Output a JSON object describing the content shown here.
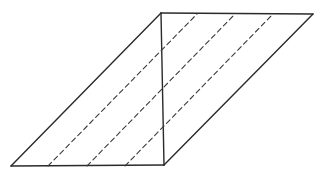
{
  "diagram": {
    "stroke_color": "#2a2a2a",
    "background": "#ffffff",
    "vertices": {
      "bottom_left": [
        11,
        166
      ],
      "top_left": [
        161,
        13
      ],
      "top_right": [
        313,
        14
      ],
      "bottom_right": [
        164,
        165
      ]
    },
    "solid_edges": [
      {
        "name": "top-edge",
        "from": [
          161,
          13
        ],
        "to": [
          313,
          14
        ]
      },
      {
        "name": "left-edge",
        "from": [
          11,
          166
        ],
        "to": [
          161,
          13
        ]
      },
      {
        "name": "bottom-edge",
        "from": [
          11,
          166
        ],
        "to": [
          164,
          165
        ]
      },
      {
        "name": "right-edge",
        "from": [
          164,
          165
        ],
        "to": [
          313,
          14
        ]
      },
      {
        "name": "vertical-divider",
        "from": [
          161,
          13
        ],
        "to": [
          164,
          165
        ]
      }
    ],
    "dashed_lines": [
      {
        "name": "dashed-line-1",
        "from": [
          48,
          166
        ],
        "to": [
          197,
          14
        ]
      },
      {
        "name": "dashed-line-2",
        "from": [
          87,
          166
        ],
        "to": [
          235,
          14
        ]
      },
      {
        "name": "dashed-line-3",
        "from": [
          125,
          166
        ],
        "to": [
          272,
          15
        ]
      }
    ]
  }
}
